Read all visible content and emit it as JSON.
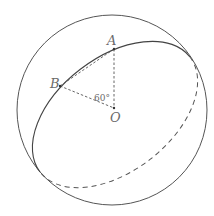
{
  "diagram": {
    "type": "sphere-great-circle",
    "sphere": {
      "cx": 112,
      "cy": 110,
      "r": 95
    },
    "great_circle": {
      "cx": 115,
      "cy": 114.5,
      "rx": 94.5,
      "ry": 57,
      "rotation_deg": -37.5
    },
    "points": {
      "A": {
        "label": "A",
        "x": 114,
        "y": 49
      },
      "B": {
        "label": "B",
        "x": 60,
        "y": 86
      },
      "O": {
        "label": "O",
        "x": 114,
        "y": 108
      }
    },
    "angle_label": "60°",
    "colors": {
      "stroke": "#555555",
      "text": "#6a6a6a"
    }
  }
}
